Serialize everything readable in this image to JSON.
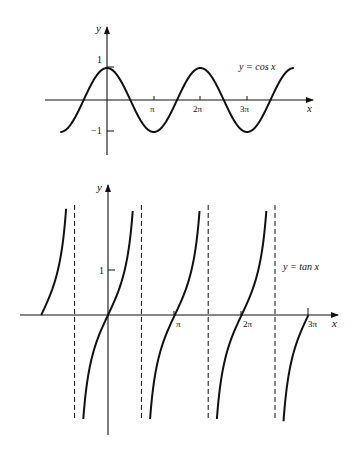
{
  "chart_data": [
    {
      "type": "line",
      "title": "",
      "function": "cos",
      "label": "y = cos x",
      "xlabel": "x",
      "ylabel": "y",
      "x_range": [
        -3.14159,
        12.566
      ],
      "ylim": [
        -1,
        1
      ],
      "x_ticks": [
        {
          "value": 3.14159,
          "label": "π"
        },
        {
          "value": 6.28319,
          "label": "2π"
        },
        {
          "value": 9.42478,
          "label": "3π"
        }
      ],
      "y_ticks": [
        {
          "value": 1,
          "label": "1"
        },
        {
          "value": -1,
          "label": "−1"
        }
      ],
      "grid": false
    },
    {
      "type": "line",
      "title": "",
      "function": "tan",
      "label": "y = tan x",
      "xlabel": "x",
      "ylabel": "y",
      "x_range": [
        -3.14159,
        9.42478
      ],
      "ylim": [
        -2.4,
        2.4
      ],
      "asymptotes": [
        -1.5708,
        1.5708,
        4.7124,
        7.854
      ],
      "x_ticks": [
        {
          "value": 3.14159,
          "label": "π"
        },
        {
          "value": 6.28319,
          "label": "2π"
        },
        {
          "value": 9.42478,
          "label": "3π"
        }
      ],
      "y_ticks": [
        {
          "value": 1,
          "label": "1"
        }
      ],
      "grid": false
    }
  ],
  "cos_graph": {
    "y_axis_label": "y",
    "x_axis_label": "x",
    "curve_label": "y = cos x",
    "tick_pi": "π",
    "tick_2pi": "2π",
    "tick_3pi": "3π",
    "tick_one": "1",
    "tick_neg_one": "−1"
  },
  "tan_graph": {
    "y_axis_label": "y",
    "x_axis_label": "x",
    "curve_label": "y = tan x",
    "tick_pi": "π",
    "tick_2pi": "2π",
    "tick_3pi": "3π",
    "tick_one": "1"
  }
}
